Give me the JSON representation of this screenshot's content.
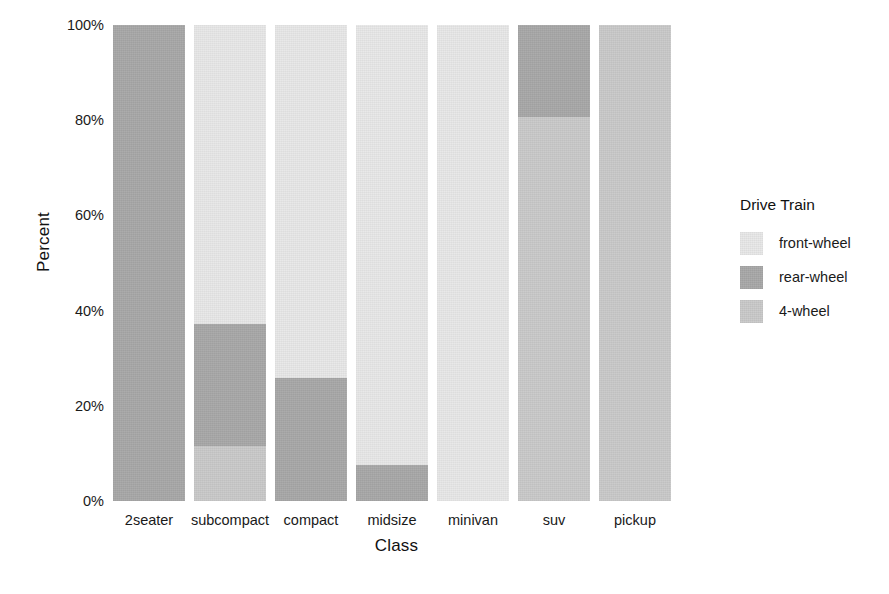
{
  "chart_data": {
    "type": "bar",
    "subtype": "stacked-100-percent",
    "title": "",
    "xlabel": "Class",
    "ylabel": "Percent",
    "categories": [
      "2seater",
      "subcompact",
      "compact",
      "midsize",
      "minivan",
      "suv",
      "pickup"
    ],
    "series": [
      {
        "name": "front-wheel",
        "color": "#e8e8e8",
        "values": [
          0.0,
          62.8,
          74.2,
          92.5,
          100.0,
          0.0,
          0.0
        ]
      },
      {
        "name": "rear-wheel",
        "color": "#a8a8a8",
        "values": [
          100.0,
          25.6,
          25.8,
          7.5,
          0.0,
          19.3,
          0.0
        ]
      },
      {
        "name": "4-wheel",
        "color": "#cacaca",
        "values": [
          0.0,
          11.6,
          0.0,
          0.0,
          0.0,
          80.7,
          100.0
        ]
      }
    ],
    "stack_order_top_to_bottom": [
      "front-wheel",
      "rear-wheel",
      "4-wheel"
    ],
    "ylim": [
      0,
      100
    ],
    "y_ticks": [
      0,
      20,
      40,
      60,
      80,
      100
    ],
    "y_tick_labels": [
      "0%",
      "20%",
      "40%",
      "60%",
      "80%",
      "100%"
    ],
    "grid": false,
    "legend_position": "right",
    "legend_title": "Drive Train",
    "legend_entries": [
      "front-wheel",
      "rear-wheel",
      "4-wheel"
    ]
  },
  "axes": {
    "y_title": "Percent",
    "x_title": "Class"
  },
  "legend": {
    "title": "Drive Train",
    "items": [
      {
        "label": "front-wheel"
      },
      {
        "label": "rear-wheel"
      },
      {
        "label": "4-wheel"
      }
    ]
  },
  "colors": {
    "front_wheel": "#e8e8e8",
    "rear_wheel": "#a8a8a8",
    "four_wheel": "#cacaca",
    "text": "#1a1a1a",
    "background": "#ffffff"
  }
}
